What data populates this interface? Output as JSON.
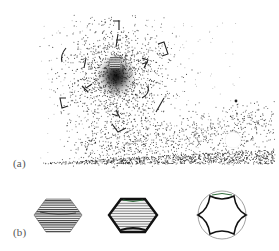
{
  "figure": {
    "panels": [
      {
        "id": "a",
        "label": "(a)",
        "description": "scattered particle cloud with bracket glyphs, sloping dense band, white disk"
      },
      {
        "id": "b",
        "label": "(b)",
        "description": "three hexagonal cross-sections: filled textured hexagon, outlined hatched hexagon, ring with concave hexagonal interior"
      }
    ]
  },
  "colors": {
    "ink": "#1a1a1a",
    "paper": "#ffffff",
    "label": "#555555",
    "accent_green": "#2e6b3a"
  }
}
